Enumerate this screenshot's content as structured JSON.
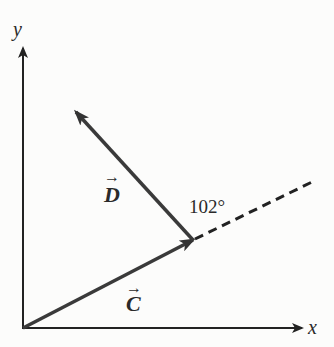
{
  "diagram": {
    "type": "vector-diagram",
    "axes": {
      "x_label": "x",
      "y_label": "y"
    },
    "vectors": [
      {
        "name": "C",
        "label": "C",
        "from": "origin",
        "description": "vector along lower-right direction"
      },
      {
        "name": "D",
        "label": "D",
        "from": "tip-of-C",
        "description": "vector pointing up-left from tip of C"
      }
    ],
    "angle": {
      "label": "102°",
      "value_deg": 102,
      "between": [
        "C-extension (dashed)",
        "D"
      ]
    },
    "colors": {
      "vector": "#3a3a3a",
      "axis": "#2a2a2a",
      "background": "#fcfcfb"
    },
    "arrow_symbol": "→"
  }
}
